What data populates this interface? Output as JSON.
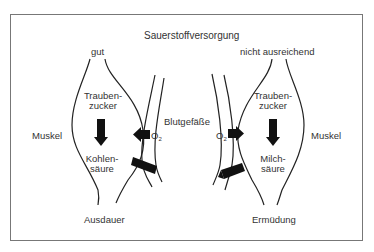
{
  "diagram": {
    "title": "Sauerstoffversorgung",
    "left": {
      "supply_label": "gut",
      "tissue_label": "Muskel",
      "input_label_line1": "Trauben-",
      "input_label_line2": "zucker",
      "output_label_line1": "Kohlen-",
      "output_label_line2": "säure",
      "outcome_label": "Ausdauer",
      "oxygen_label": "O",
      "oxygen_sub": "2"
    },
    "center": {
      "vessel_label": "Blutgefäße"
    },
    "right": {
      "supply_label": "nicht ausreichend",
      "tissue_label": "Muskel",
      "input_label_line1": "Trauben-",
      "input_label_line2": "zucker",
      "output_label_line1": "Milch-",
      "output_label_line2": "säure",
      "outcome_label": "Ermüdung",
      "oxygen_label": "O",
      "oxygen_sub": "2"
    },
    "colors": {
      "line": "#222222",
      "arrow": "#111111",
      "frame": "#777777"
    }
  }
}
